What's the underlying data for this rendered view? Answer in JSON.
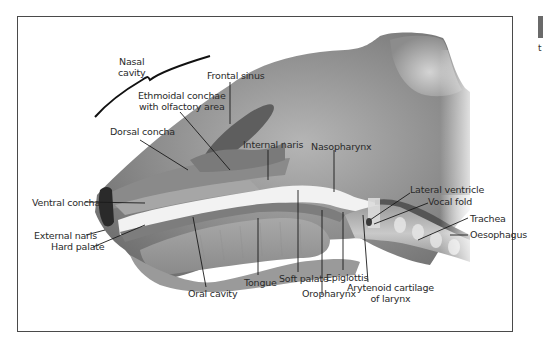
{
  "figure": {
    "colors": {
      "frame_border": "#4a4a4a",
      "tissue_dark": "#6e6e6e",
      "tissue_mid": "#9a9a9a",
      "tissue_light": "#c8c8c8",
      "airway_white": "#f2f2f2",
      "leader_line": "#1a1a1a",
      "label_text": "#2a2a2a"
    }
  },
  "labels": {
    "nasal_cavity_line1": "Nasal",
    "nasal_cavity_line2": "cavity",
    "frontal_sinus": "Frontal sinus",
    "ethmoidal_line1": "Ethmoidal conchae",
    "ethmoidal_line2": "with olfactory area",
    "dorsal_concha": "Dorsal concha",
    "internal_naris": "Internal naris",
    "nasopharynx": "Nasopharynx",
    "lateral_ventricle": "Lateral ventricle",
    "vocal_fold": "Vocal fold",
    "trachea": "Trachea",
    "oesophagus": "Oesophagus",
    "ventral_concha": "Ventral concha",
    "external_naris": "External naris",
    "hard_palate": "Hard palate",
    "oral_cavity": "Oral cavity",
    "tongue": "Tongue",
    "soft_palate": "Soft palate",
    "epiglottis": "Epiglottis",
    "oropharynx": "Oropharynx",
    "arytenoid_line1": "Arytenoid cartilage",
    "arytenoid_line2": "of larynx"
  },
  "edge_mark": "t"
}
